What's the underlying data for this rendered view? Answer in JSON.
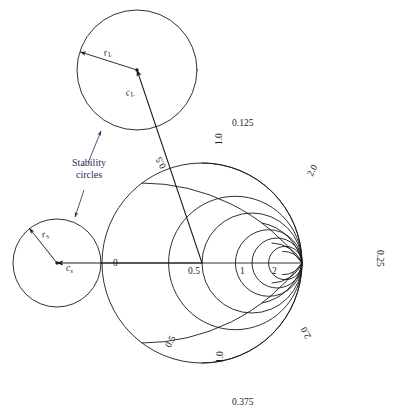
{
  "figure": {
    "kind": "smith-chart-stability-circles",
    "annotation_text": "Stability\ncircles",
    "annotation_line1": "Stability",
    "annotation_line2": "circles",
    "ink_color": "#1a1a1a",
    "annotation_color": "#2b2b55"
  },
  "smith_chart": {
    "center_marker_label": "1",
    "axis_labels": [
      {
        "text": "0",
        "value": 0.0
      },
      {
        "text": "0.5",
        "value": 0.5
      },
      {
        "text": "1",
        "value": 1.0
      },
      {
        "text": "2",
        "value": 2.0
      }
    ],
    "rim_wavelength_labels": [
      {
        "text": "0.125",
        "position": "top"
      },
      {
        "text": "0.25",
        "position": "right"
      },
      {
        "text": "0.375",
        "position": "bottom"
      }
    ],
    "rim_reactance_labels": [
      {
        "text": "0.5",
        "position": "upper-left"
      },
      {
        "text": "1.0",
        "position": "top"
      },
      {
        "text": "2.0",
        "position": "upper-right"
      },
      {
        "text": "0.5",
        "position": "lower-left"
      },
      {
        "text": "1.0",
        "position": "bottom"
      },
      {
        "text": "2.0",
        "position": "lower-right"
      }
    ],
    "resistance_circles": [
      0.5,
      1,
      2,
      3,
      5
    ],
    "reactance_arcs": [
      0.5,
      1,
      2,
      3,
      5
    ]
  },
  "stability_circles": [
    {
      "id": "source",
      "center_label": "c",
      "center_subscript": "s",
      "radius_label": "r",
      "radius_subscript": "s"
    },
    {
      "id": "load",
      "center_label": "c",
      "center_subscript": "L",
      "radius_label": "r",
      "radius_subscript": "L"
    }
  ]
}
